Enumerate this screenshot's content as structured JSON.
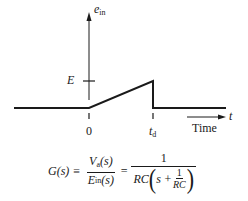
{
  "diagram": {
    "y_axis_label": "e",
    "y_axis_label_sub": "in",
    "level_label": "E",
    "tick_labels": [
      "0",
      "t"
    ],
    "tick_label_td_sub": "d",
    "time_axis_label": "Time",
    "time_arrow_label": "t",
    "waveform": {
      "description": "ramp from 0 at t=0 to E at t=t_d, then drops to 0",
      "points": [
        [
          -1,
          0
        ],
        [
          0,
          0
        ],
        [
          1,
          1
        ],
        [
          1,
          0
        ],
        [
          2,
          0
        ]
      ]
    }
  },
  "equation": {
    "lhs": "G(s)",
    "equiv": "≡",
    "frac1_num": "V",
    "frac1_num_sub": "a",
    "frac1_num_arg": "(s)",
    "frac1_den": "E",
    "frac1_den_sub": "in",
    "frac1_den_arg": "(s)",
    "eq": "=",
    "frac2_num": "1",
    "frac2_den_rc": "RC",
    "frac2_den_s": "s +",
    "inner_num": "1",
    "inner_den": "RC",
    "open_paren": "(",
    "close_paren": ")"
  }
}
